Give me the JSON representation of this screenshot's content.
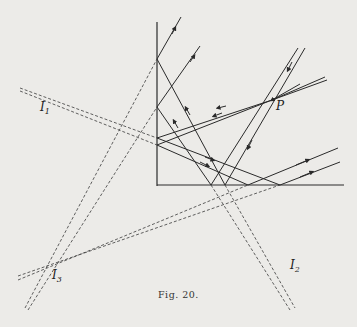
{
  "figure": {
    "caption": "Fig. 20.",
    "labels": {
      "P": "P",
      "I1": {
        "main": "I",
        "sub": "1"
      },
      "I2": {
        "main": "I",
        "sub": "2"
      },
      "I3": {
        "main": "I",
        "sub": "3"
      }
    },
    "colors": {
      "ink": "#2a2a2a",
      "paper": "#ecebe8"
    }
  }
}
